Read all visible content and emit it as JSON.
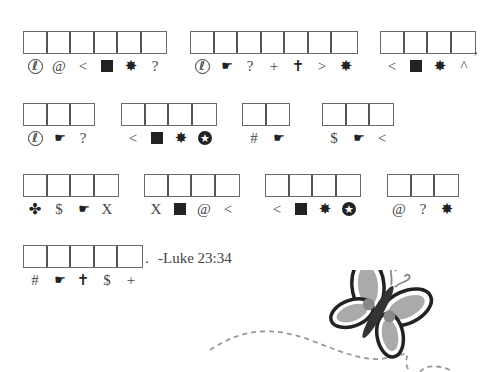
{
  "puzzle": {
    "rows": [
      {
        "words": [
          {
            "codes": [
              "phone",
              "@",
              "<",
              "square",
              "burst",
              "?"
            ]
          },
          {
            "codes": [
              "phone",
              "hand",
              "?",
              "+",
              "cross",
              ">",
              "burst"
            ]
          },
          {
            "codes": [
              "<",
              "square",
              "burst",
              "^"
            ],
            "trailing": ","
          }
        ]
      },
      {
        "words": [
          {
            "codes": [
              "phone",
              "hand",
              "?"
            ]
          },
          {
            "codes": [
              "<",
              "square",
              "burst",
              "star-circle"
            ]
          },
          {
            "codes": [
              "#",
              "hand"
            ]
          },
          {
            "codes": [
              "$",
              "hand",
              "<"
            ]
          }
        ]
      },
      {
        "words": [
          {
            "codes": [
              "club",
              "$",
              "hand",
              "X"
            ]
          },
          {
            "codes": [
              "X",
              "square",
              "@",
              "<"
            ]
          },
          {
            "codes": [
              "<",
              "square",
              "burst",
              "star-circle"
            ]
          },
          {
            "codes": [
              "@",
              "?",
              "burst"
            ]
          }
        ]
      },
      {
        "words": [
          {
            "codes": [
              "#",
              "hand",
              "cross",
              "$",
              "+"
            ],
            "trailing": "."
          }
        ]
      }
    ],
    "reference": "-Luke 23:34",
    "symbol_legend": {
      "phone": "✆",
      "hand": "☛",
      "square": "■",
      "burst": "✸",
      "cross": "✝",
      "club": "✤",
      "star-circle": "★"
    }
  },
  "labels": {
    "comma": ",",
    "period": ".",
    "reference": "-Luke 23:34"
  },
  "decoration": {
    "butterfly": "butterfly-illustration",
    "flight_path": "dashed-line"
  }
}
